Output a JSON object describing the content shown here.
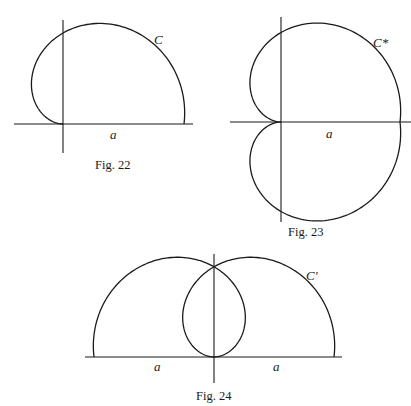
{
  "figures": [
    {
      "id": "fig22",
      "caption": "Fig. 22",
      "curve_label": "C",
      "segment_label": "a",
      "description": "Upper half curve C over segment of length a, with axis through origin"
    },
    {
      "id": "fig23",
      "caption": "Fig. 23",
      "curve_label": "C*",
      "segment_label": "a",
      "description": "Cardioid-like closed curve C*, symmetric about horizontal axis, cusp at origin"
    },
    {
      "id": "fig24",
      "caption": "Fig. 24",
      "curve_label": "C'",
      "segment_labels": [
        "a",
        "a"
      ],
      "description": "Curve C' formed by two mirrored arcs with inner loop, over two segments of length a"
    }
  ],
  "colors": {
    "ink": "#1a1a1a",
    "background": "#ffffff"
  }
}
